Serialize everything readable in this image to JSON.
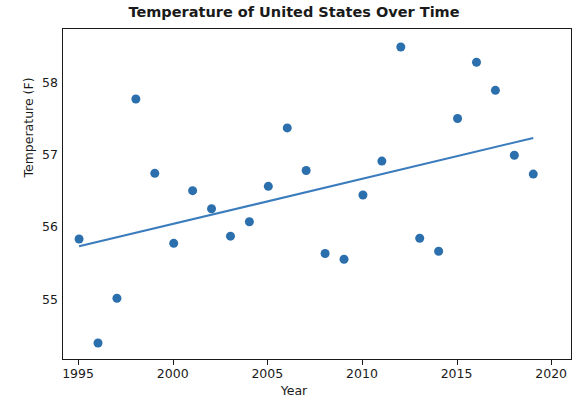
{
  "chart_data": {
    "type": "scatter",
    "title": "Temperature of United States Over Time",
    "xlabel": "Year",
    "ylabel": "Temperature (F)",
    "xlim": [
      1994.0,
      1994.0
    ],
    "ylim": [
      54.0,
      54.0
    ],
    "axis": {
      "x_min": 1994.15,
      "x_max": 2021.1,
      "y_min": 54.15,
      "y_max": 58.75
    },
    "grid": false,
    "legend": null,
    "xticks": [
      1995,
      2000,
      2005,
      2010,
      2015,
      2020
    ],
    "xtick_labels": [
      "1995",
      "2000",
      "2005",
      "2010",
      "2015",
      "2020"
    ],
    "yticks": [
      55,
      56,
      57,
      58
    ],
    "ytick_labels": [
      "55",
      "56",
      "57",
      "58"
    ],
    "marker_color": "#2c6fad",
    "line_color": "#3b7cbd",
    "marker_size": 9,
    "series": [
      {
        "name": "Annual mean temperature",
        "type": "scatter",
        "x": [
          1995,
          1996,
          1997,
          1998,
          1999,
          2000,
          2001,
          2002,
          2003,
          2004,
          2005,
          2006,
          2007,
          2008,
          2009,
          2010,
          2011,
          2012,
          2013,
          2014,
          2015,
          2016,
          2017,
          2018,
          2019
        ],
        "y": [
          55.84,
          54.4,
          55.02,
          57.78,
          56.75,
          55.78,
          56.51,
          56.26,
          55.88,
          56.08,
          56.57,
          57.38,
          56.79,
          55.64,
          55.56,
          56.45,
          56.92,
          58.5,
          55.85,
          55.67,
          57.51,
          58.29,
          57.9,
          57.0,
          56.74
        ]
      },
      {
        "name": "Trend line",
        "type": "line",
        "x": [
          1995,
          2019
        ],
        "y": [
          55.74,
          57.24
        ]
      }
    ]
  }
}
